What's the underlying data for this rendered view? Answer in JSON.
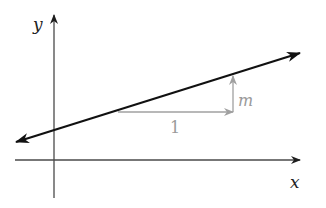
{
  "diagram": {
    "type": "slope-illustration",
    "axes": {
      "x_label": "x",
      "y_label": "y",
      "axis_color": "#4a4a4a"
    },
    "line": {
      "description": "Line with positive slope, arrows on both ends",
      "color": "#1a1a1a"
    },
    "slope_triangle": {
      "run_label": "1",
      "rise_label": "m",
      "color": "#a0a0a0"
    }
  }
}
